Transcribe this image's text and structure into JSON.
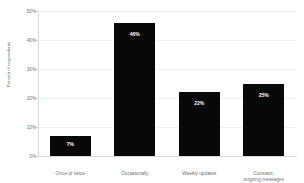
{
  "chart_data": {
    "type": "bar",
    "title": "",
    "xlabel": "",
    "ylabel": "Percent of respondents",
    "categories": [
      "Once or twice",
      "Occasionally",
      "Weekly updates",
      "Constant, ongoing messages"
    ],
    "category_lines": [
      [
        "Once or twice",
        ""
      ],
      [
        "Occasionally",
        ""
      ],
      [
        "Weekly updates",
        ""
      ],
      [
        "Constant,",
        "ongoing messages"
      ]
    ],
    "values": [
      7,
      46,
      22,
      25
    ],
    "value_labels": [
      "7%",
      "46%",
      "22%",
      "25%"
    ],
    "ylim": [
      0,
      50
    ],
    "yticks": [
      0,
      10,
      20,
      30,
      40,
      50
    ],
    "ytick_labels": [
      "0%",
      "10%",
      "20%",
      "30%",
      "40%",
      "50%"
    ],
    "grid": true,
    "legend": "none",
    "bar_color": "#080808",
    "value_label_color": "#ffffff",
    "axis_color": "#d8d8da",
    "grid_color": "#f0f0f1",
    "tick_text_color": "#6e6e73",
    "background": "#ffffff"
  }
}
